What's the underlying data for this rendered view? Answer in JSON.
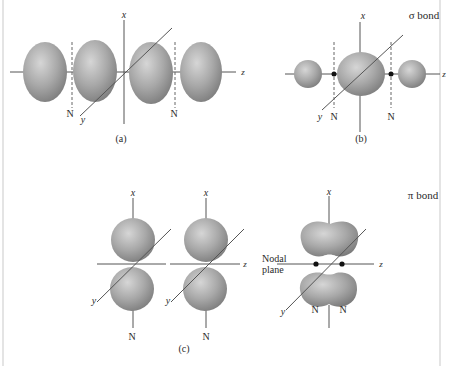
{
  "figure": {
    "panels": [
      {
        "id": "a",
        "caption": "(a)",
        "axis_labels": {
          "x": "x",
          "y": "y",
          "z": "z"
        },
        "node_labels": [
          "N",
          "N"
        ],
        "description": "Four lobes along z-axis (two p orbitals overlapping out of phase end-on), two nodal planes N"
      },
      {
        "id": "b",
        "caption": "(b)",
        "title": "σ bond",
        "axis_labels": {
          "x": "x",
          "y": "y",
          "z": "z"
        },
        "node_labels": [
          "N",
          "N"
        ],
        "description": "Large central lobe with two small side lobes; nodes marked by dots"
      },
      {
        "id": "c",
        "caption": "(c)",
        "title": "π bond",
        "axis_labels": {
          "x1": "x",
          "x2": "x",
          "x3": "x",
          "y1": "y",
          "y2": "y",
          "y3": "y",
          "z1": "z",
          "z2": "z"
        },
        "node_labels": [
          "N",
          "N",
          "N",
          "N"
        ],
        "nodal_plane_label_line1": "Nodal",
        "nodal_plane_label_line2": "plane",
        "description": "Two side-by-side p orbitals combine into a π bond with a nodal plane"
      }
    ],
    "colors": {
      "lobe_light": "#d4d4d4",
      "lobe_mid": "#a9a9a9",
      "lobe_dark": "#7a7a7a",
      "axis": "#555555",
      "text": "#2a2a2a",
      "background": "#ffffff"
    }
  }
}
